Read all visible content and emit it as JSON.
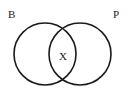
{
  "diagram": {
    "type": "venn",
    "sets": [
      {
        "name": "B",
        "label": "B"
      },
      {
        "name": "P",
        "label": "P"
      }
    ],
    "intersection": {
      "sets": [
        "B",
        "P"
      ],
      "label": "X"
    },
    "stroke_color": "#1a1a1a",
    "background": "#ffffff"
  }
}
